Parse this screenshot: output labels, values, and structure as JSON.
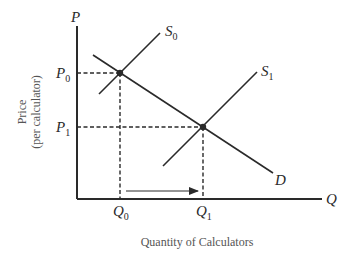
{
  "diagram": {
    "y_axis": {
      "symbol": "P",
      "title_line1": "Price",
      "title_line2": "(per calculator)"
    },
    "x_axis": {
      "symbol": "Q",
      "title": "Quantity of Calculators"
    },
    "curves": {
      "s0": {
        "label": "S",
        "sub": "0"
      },
      "s1": {
        "label": "S",
        "sub": "1"
      },
      "d": {
        "label": "D"
      }
    },
    "price_ticks": [
      {
        "label": "P",
        "sub": "0"
      },
      {
        "label": "P",
        "sub": "1"
      }
    ],
    "quantity_ticks": [
      {
        "label": "Q",
        "sub": "0"
      },
      {
        "label": "Q",
        "sub": "1"
      }
    ],
    "equilibria": [
      {
        "name": "E0",
        "price": "P0",
        "quantity": "Q0"
      },
      {
        "name": "E1",
        "price": "P1",
        "quantity": "Q1"
      }
    ],
    "annotation": "Arrow from Q0 to Q1 indicating increase in quantity",
    "colors": {
      "line": "#2a2a2a",
      "text": "#2a2a2a",
      "axis_title": "#555555",
      "background": "#ffffff"
    }
  }
}
